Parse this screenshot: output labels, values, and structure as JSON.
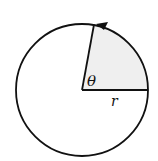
{
  "diagram": {
    "type": "circle-sector",
    "labels": {
      "angle": "θ",
      "radius": "r"
    },
    "colors": {
      "stroke": "#111111",
      "sector_fill": "#efefef",
      "background": "#ffffff"
    }
  }
}
